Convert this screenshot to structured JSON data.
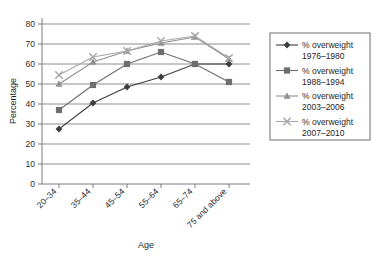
{
  "chart_data": {
    "type": "line",
    "title": "",
    "xlabel": "Age",
    "ylabel": "Percentage",
    "categories": [
      "20–34",
      "35–44",
      "45–54",
      "55–64",
      "65–74",
      "75 and above"
    ],
    "ylim": [
      0,
      80
    ],
    "yticks": [
      0,
      10,
      20,
      30,
      40,
      50,
      60,
      70,
      80
    ],
    "grid": true,
    "legend_position": "right",
    "series": [
      {
        "name": "% overweight 1976–1980",
        "label_line1": "% overweight",
        "label_line2": "1976–1980",
        "marker": "diamond",
        "color": "#3d3d3d",
        "values": [
          27.5,
          40.5,
          48.5,
          53.5,
          60,
          60
        ]
      },
      {
        "name": "% overweight 1988–1994",
        "label_line1": "% overweight",
        "label_line2": "1988–1994",
        "marker": "square",
        "color": "#6e6e6e",
        "values": [
          37,
          49.5,
          60,
          66,
          60,
          51
        ]
      },
      {
        "name": "% overweight 2003–2006",
        "label_line1": "% overweight",
        "label_line2": "2003–2006",
        "marker": "triangle",
        "color": "#909090",
        "values": [
          50,
          61,
          66.5,
          70.5,
          73.5,
          62.5
        ]
      },
      {
        "name": "% overweight 2007–2010",
        "label_line1": "% overweight",
        "label_line2": "2007–2010",
        "marker": "cross",
        "color": "#a8a8a8",
        "values": [
          54.5,
          63.5,
          66.5,
          71.5,
          74,
          63
        ]
      }
    ]
  },
  "yticklabels": [
    "80",
    "70",
    "60",
    "50",
    "40",
    "30",
    "20",
    "10",
    "0"
  ]
}
